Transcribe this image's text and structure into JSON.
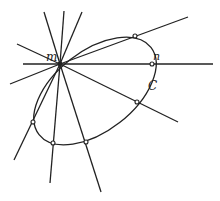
{
  "diagram": {
    "labels": {
      "m": "m",
      "n": "n",
      "curve": "C"
    },
    "center_point": {
      "x": 60,
      "y": 64
    },
    "conic": {
      "cx": 95,
      "cy": 91,
      "rx": 71,
      "ry": 40,
      "rotation": -38
    },
    "lines": [
      {
        "x2": 44,
        "y2": 12
      },
      {
        "x2": 64,
        "y2": 11
      },
      {
        "x2": 82,
        "y2": 12
      },
      {
        "x2": 17,
        "y2": 44
      },
      {
        "x2": 23,
        "y2": 64
      },
      {
        "x2": 10,
        "y2": 84
      },
      {
        "x2": 188,
        "y2": 17
      },
      {
        "x2": 213,
        "y2": 64
      },
      {
        "x2": 178,
        "y2": 122
      },
      {
        "x2": 14,
        "y2": 160
      },
      {
        "x2": 50,
        "y2": 183
      },
      {
        "x2": 101,
        "y2": 192
      }
    ],
    "intersection_points": [
      {
        "x": 135,
        "y": 36
      },
      {
        "x": 152,
        "y": 64
      },
      {
        "x": 137,
        "y": 102
      },
      {
        "x": 86,
        "y": 142
      },
      {
        "x": 53,
        "y": 143
      },
      {
        "x": 33,
        "y": 122
      }
    ],
    "colors": {
      "stroke": "#222222",
      "background": "#ffffff"
    }
  }
}
